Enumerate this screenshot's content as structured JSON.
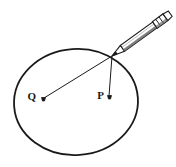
{
  "figure": {
    "type": "geometry-diagram",
    "background_color": "#ffffff",
    "stroke_color": "#1a1a1a",
    "canvas": {
      "width": 176,
      "height": 167
    },
    "circle": {
      "name": "main-circle",
      "center_x": 76,
      "center_y": 102,
      "radius_x": 62,
      "radius_y": 53,
      "rotation_deg": -4,
      "stroke_width": 1.8
    },
    "contact_point": {
      "name": "pencil-contact-point",
      "x": 112,
      "y": 56
    },
    "points": [
      {
        "id": "q",
        "label": "Q",
        "x": 43,
        "y": 99,
        "label_x": 37,
        "label_y": 99,
        "marker": "dot"
      },
      {
        "id": "p",
        "label": "P",
        "x": 109,
        "y": 97,
        "label_x": 105,
        "label_y": 97,
        "marker": "dot"
      }
    ],
    "segments": [
      {
        "id": "segment-q-to-contact",
        "from": "q",
        "to": "contact_point",
        "x1": 44,
        "y1": 98,
        "x2": 112,
        "y2": 56,
        "stroke_width": 1.0
      },
      {
        "id": "segment-p-to-contact",
        "from": "p",
        "to": "contact_point",
        "x1": 109,
        "y1": 96,
        "x2": 112,
        "y2": 56,
        "stroke_width": 1.0
      }
    ],
    "pencil": {
      "name": "pencil",
      "tip_x": 112,
      "tip_y": 56,
      "end_x": 173,
      "end_y": 11,
      "angle_deg": -36,
      "length": 76,
      "body_width": 7,
      "ferrule_label": "ferrule",
      "eraser_label": "eraser",
      "shaft_color": "#ffffff",
      "outline_color": "#1a1a1a",
      "shade_color": "#555555"
    }
  }
}
